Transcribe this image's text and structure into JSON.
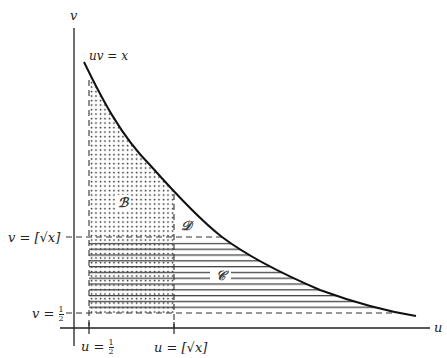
{
  "diagram": {
    "axes": {
      "u_label": "u",
      "v_label": "v"
    },
    "curve_label": "uv = x",
    "region_labels": {
      "B": "ℬ",
      "C": "𝒞",
      "D": "𝒟"
    },
    "v_ticks": [
      {
        "text": "v = [√x]",
        "id": "v-sqrt-x"
      },
      {
        "text": "v = ",
        "frac_num": "1",
        "frac_den": "2",
        "id": "v-half"
      }
    ],
    "u_ticks": [
      {
        "text": "u = ",
        "frac_num": "1",
        "frac_den": "2",
        "id": "u-half"
      },
      {
        "text": "u = [√x]",
        "id": "u-sqrt-x"
      }
    ],
    "colors": {
      "ink": "#222222",
      "background": "#ffffff"
    }
  }
}
